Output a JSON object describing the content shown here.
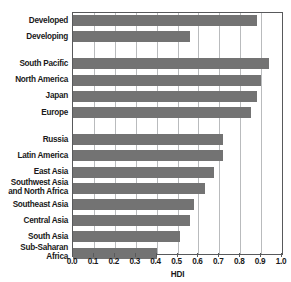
{
  "chart_data": {
    "type": "bar",
    "orientation": "horizontal",
    "title": "",
    "xlabel": "HDI",
    "ylabel": "",
    "xlim": [
      0.0,
      1.0
    ],
    "grid": true,
    "legend": false,
    "xticks": [
      "0.0",
      "0.1",
      "0.2",
      "0.3",
      "0.4",
      "0.5",
      "0.6",
      "0.7",
      "0.8",
      "0.9",
      "1.0"
    ],
    "groups": [
      {
        "name": "development-status",
        "categories": [
          "Developed",
          "Developing"
        ],
        "values": [
          0.88,
          0.56
        ]
      },
      {
        "name": "high-income-regions",
        "categories": [
          "South Pacific",
          "North America",
          "Japan",
          "Europe"
        ],
        "values": [
          0.94,
          0.9,
          0.88,
          0.85
        ]
      },
      {
        "name": "other-regions",
        "categories": [
          "Russia",
          "Latin America",
          "East Asia",
          "Southwest Asia\nand North Africa",
          "Southeast Asia",
          "Central Asia",
          "South Asia",
          "Sub-Saharan Africa"
        ],
        "values": [
          0.72,
          0.72,
          0.675,
          0.63,
          0.58,
          0.56,
          0.51,
          0.4
        ]
      }
    ],
    "categories": [
      "Developed",
      "Developing",
      "South Pacific",
      "North America",
      "Japan",
      "Europe",
      "Russia",
      "Latin America",
      "East Asia",
      "Southwest Asia and North Africa",
      "Southeast Asia",
      "Central Asia",
      "South Asia",
      "Sub-Saharan Africa"
    ],
    "values": [
      0.88,
      0.56,
      0.94,
      0.9,
      0.88,
      0.85,
      0.72,
      0.72,
      0.675,
      0.63,
      0.58,
      0.56,
      0.51,
      0.4
    ],
    "colors": {
      "bar": "#737373",
      "gridline": "#b9bbbd",
      "axis": "#58595b",
      "text": "#1a1a1a",
      "background": "#ffffff"
    }
  }
}
